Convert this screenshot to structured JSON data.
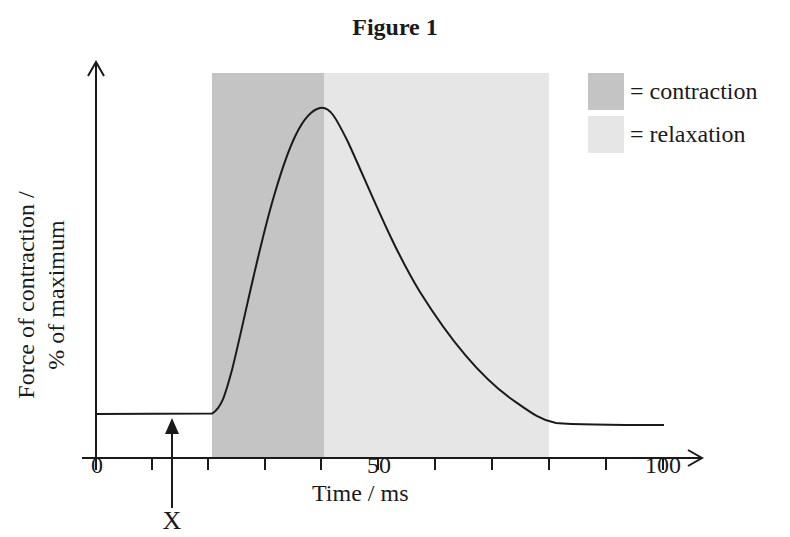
{
  "title": "Figure 1",
  "axes": {
    "x_label": "Time / ms",
    "y_label_line1": "Force of contraction /",
    "y_label_line2": "% of maximum",
    "x_ticks": [
      {
        "value": 0,
        "label": "0"
      },
      {
        "value": 50,
        "label": "50"
      },
      {
        "value": 100,
        "label": "100"
      }
    ]
  },
  "legend": {
    "items": [
      {
        "label": "= contraction",
        "color": "#c4c4c4"
      },
      {
        "label": "= relaxation",
        "color": "#e6e6e6"
      }
    ]
  },
  "marker": {
    "label": "X",
    "time_ms": 7
  }
}
